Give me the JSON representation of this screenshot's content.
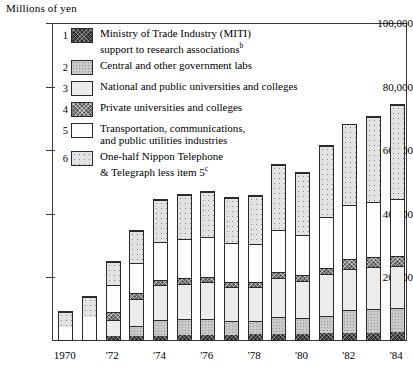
{
  "axis_title": "Millions of yen",
  "chart_data": {
    "type": "bar",
    "subtype": "stacked-bar",
    "title": "",
    "xlabel": "",
    "ylabel": "Millions of yen",
    "ylim": [
      0,
      100000
    ],
    "yticks": [
      0,
      20000,
      40000,
      60000,
      80000,
      100000
    ],
    "ytick_labels": [
      "",
      "20,000",
      "40,000",
      "60,000",
      "80,000",
      "100,000"
    ],
    "grid": false,
    "legend_position": "upper-left-inside",
    "categories": [
      "1970",
      "1971",
      "1972",
      "1973",
      "1974",
      "1975",
      "1976",
      "1977",
      "1978",
      "1979",
      "1980",
      "1981",
      "1982",
      "1983",
      "1984"
    ],
    "xtick_labels": [
      "1970",
      "'72",
      "'74",
      "'76",
      "'78",
      "'80",
      "'82",
      "'84"
    ],
    "xtick_categories": [
      "1970",
      "1972",
      "1974",
      "1976",
      "1978",
      "1980",
      "1982",
      "1984"
    ],
    "series": [
      {
        "name": "Ministry of Trade Industry (MITI) support to research associations",
        "key": "miti",
        "pattern": "p1",
        "values": [
          0,
          0,
          1200,
          1300,
          1400,
          1500,
          1600,
          1700,
          1800,
          1900,
          2000,
          2100,
          2200,
          2300,
          2400
        ]
      },
      {
        "name": "Central and other government labs",
        "key": "central_gov_labs",
        "pattern": "p2",
        "values": [
          0,
          0,
          0,
          3100,
          5000,
          5100,
          5200,
          4300,
          4400,
          5500,
          5100,
          5600,
          7300,
          7500,
          7600
        ]
      },
      {
        "name": "National and public universities and colleges",
        "key": "national_universities",
        "pattern": "p3",
        "values": [
          0,
          0,
          5300,
          8800,
          11000,
          11300,
          11600,
          10900,
          10600,
          12200,
          11700,
          13200,
          13100,
          13300,
          13500
        ]
      },
      {
        "name": "Private universities and colleges",
        "key": "private_universities",
        "pattern": "p4",
        "values": [
          0,
          0,
          2400,
          1700,
          1700,
          1800,
          1800,
          1700,
          1700,
          2000,
          1900,
          2000,
          3000,
          3200,
          3300
        ]
      },
      {
        "name": "Transportation, communications, and public utilities industries",
        "key": "transport_comm_utilities",
        "pattern": "p5",
        "values": [
          4400,
          7600,
          8900,
          9900,
          12300,
          12500,
          12600,
          12400,
          12100,
          13500,
          12600,
          16200,
          17400,
          17600,
          17800
        ]
      },
      {
        "name": "One-half Nippon Telephone & Telegraph less item 5",
        "key": "nippon_telegraph_half",
        "pattern": "p6",
        "values": [
          5000,
          6700,
          7500,
          10100,
          13400,
          14000,
          14400,
          14200,
          15200,
          20700,
          19800,
          22400,
          25400,
          27000,
          29800
        ]
      }
    ],
    "totals": [
      9400,
      14300,
      25300,
      34900,
      44800,
      46200,
      47200,
      45200,
      45800,
      55800,
      53100,
      61500,
      68400,
      70900,
      74400
    ],
    "footnotes": {
      "b": "b",
      "c": "c"
    }
  },
  "legend": {
    "items": [
      {
        "num": "1",
        "pattern": "p1",
        "line1": "Ministry of Trade Industry (MITI)",
        "line2": "support to research associations",
        "sup": "b"
      },
      {
        "num": "2",
        "pattern": "p2",
        "line1": "Central and other government labs",
        "line2": "",
        "sup": ""
      },
      {
        "num": "3",
        "pattern": "p3",
        "line1": "National and public universities and colleges",
        "line2": "",
        "sup": ""
      },
      {
        "num": "4",
        "pattern": "p4",
        "line1": "Private universities and colleges",
        "line2": "",
        "sup": ""
      },
      {
        "num": "5",
        "pattern": "p5",
        "line1": "Transportation, communications,",
        "line2": "and public utilities industries",
        "sup": ""
      },
      {
        "num": "6",
        "pattern": "p6",
        "line1": "One-half Nippon Telephone",
        "line2": "& Telegraph less item 5",
        "sup": "c"
      }
    ]
  }
}
